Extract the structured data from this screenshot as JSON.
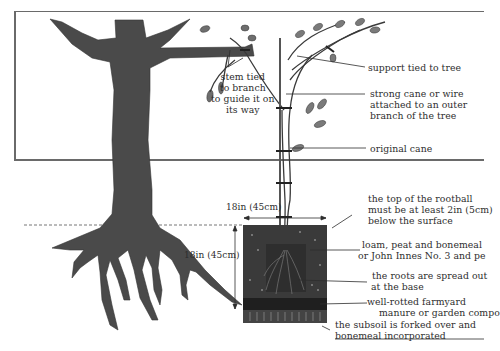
{
  "diagram": {
    "labels": {
      "stem_tied": [
        "stem tied",
        "to branch",
        "to guide it on",
        "its way"
      ],
      "support_tied": "support tied to tree",
      "strong_cane": [
        "strong cane or wire",
        "attached to an outer",
        "branch of the tree"
      ],
      "original_cane": "original cane",
      "rootball_top": [
        "the top of the rootball",
        "must be at least 2in (5cm)",
        "below the surface"
      ],
      "loam": [
        "loam, peat and bonemeal",
        "or John Innes No. 3 and pe"
      ],
      "roots_spread": [
        "the roots are spread out",
        "at the base"
      ],
      "manure": [
        "well-rotted farmyard",
        "manure or garden compo"
      ],
      "subsoil": [
        "the subsoil is forked over and",
        "bonemeal incorporated"
      ]
    },
    "dimensions": {
      "width": "18in (45cm)",
      "depth": "18in (45cm)"
    },
    "colors": {
      "tree": "#4a4a4a",
      "soil": "#3a3a3a",
      "manure": "#1f1f1f",
      "line": "#2d2d2d",
      "frame": "#6a6a6a",
      "leaf": "#6e6e6e"
    }
  }
}
